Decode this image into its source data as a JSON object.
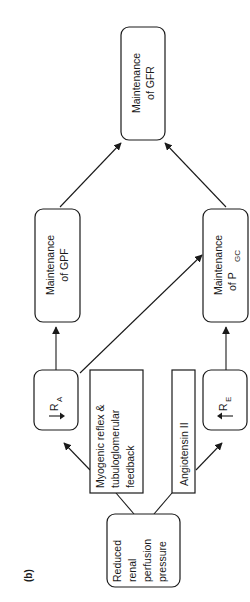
{
  "figure": {
    "label": "(b)",
    "orientation": "rotated 90° counter-clockwise"
  },
  "nodes": {
    "reduced": {
      "lines": [
        "Reduced",
        "renal",
        "perfusion",
        "pressure"
      ]
    },
    "myogenic": {
      "lines": [
        "Myogenic reflex &",
        "tubuloglomerular",
        "feedback"
      ]
    },
    "angiotensin": {
      "lines": [
        "Angiotensin II"
      ]
    },
    "ra": {
      "symbol": "R",
      "subscript": "A",
      "direction": "down",
      "meaning": "decreased afferent arteriolar resistance"
    },
    "re": {
      "symbol": "R",
      "subscript": "E",
      "direction": "up",
      "meaning": "increased efferent arteriolar resistance"
    },
    "gpf": {
      "lines": [
        "Maintenance",
        "of GPF"
      ]
    },
    "pgc": {
      "line1": "Maintenance",
      "line2_prefix": "of P",
      "line2_sub": "GC"
    },
    "gfr": {
      "lines": [
        "Maintenance",
        "of GFR"
      ]
    }
  },
  "edges": [
    {
      "from": "reduced",
      "to": "myogenic",
      "arrow": false
    },
    {
      "from": "reduced",
      "to": "angiotensin",
      "arrow": false
    },
    {
      "from": "myogenic",
      "to": "ra",
      "arrow": true
    },
    {
      "from": "angiotensin",
      "to": "re",
      "arrow": true
    },
    {
      "from": "ra",
      "to": "gpf",
      "arrow": true
    },
    {
      "from": "ra",
      "to": "pgc",
      "arrow": true
    },
    {
      "from": "re",
      "to": "pgc",
      "arrow": true
    },
    {
      "from": "gpf",
      "to": "gfr",
      "arrow": true
    },
    {
      "from": "pgc",
      "to": "gfr",
      "arrow": true
    }
  ]
}
